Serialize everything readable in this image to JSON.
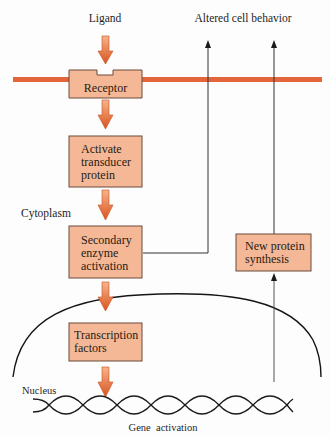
{
  "diagram": {
    "colors": {
      "membrane": "#e2663a",
      "box_fill": "#f4b896",
      "box_border": "#6a4a3a",
      "arrow_light": "#f5a77e",
      "arrow_dark": "#dd5a26",
      "line": "#222222"
    },
    "labels": {
      "ligand": "Ligand",
      "altered": "Altered cell behavior",
      "cytoplasm": "Cytoplasm",
      "nucleus": "Nucleus",
      "gene_activation": "Gene  activation"
    },
    "boxes": {
      "receptor": {
        "lines": [
          "Receptor"
        ]
      },
      "transducer": {
        "lines": [
          "Activate",
          "transducer",
          "protein"
        ]
      },
      "secondary": {
        "lines": [
          "Secondary",
          "enzyme",
          "activation"
        ]
      },
      "transcription": {
        "lines": [
          "Transcription",
          "factors"
        ]
      },
      "new_protein": {
        "lines": [
          "New protein",
          "synthesis"
        ]
      }
    }
  }
}
